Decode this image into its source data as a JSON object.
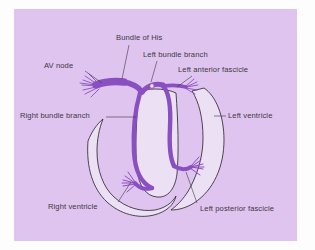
{
  "figure": {
    "panel_color": "#dfc4ef",
    "page_color": "#fdfdfd",
    "conduction_color": "#8a4fc0",
    "myocardium_color": "#ece0f5",
    "outline_color": "#2f2a33",
    "label_color": "#40383f"
  },
  "labels": {
    "bundle_of_his": "Bundle of His",
    "left_bundle_branch": "Left bundle branch",
    "left_anterior_fascicle": "Left anterior fascicle",
    "av_node": "AV node",
    "right_bundle_branch": "Right bundle branch",
    "left_ventricle": "Left ventricle",
    "right_ventricle": "Right ventricle",
    "left_posterior_fascicle": "Left posterior fascicle"
  }
}
